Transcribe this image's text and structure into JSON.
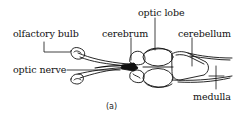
{
  "figure": {
    "caption": "(a)",
    "labels": {
      "olfactory_bulb": "olfactory bulb",
      "optic_nerve": "optic nerve",
      "cerebrum": "cerebrum",
      "optic_lobe": "optic lobe",
      "cerebellum": "cerebellum",
      "medulla": "medulla"
    },
    "colors": {
      "ink": "#111111",
      "background": "#ffffff"
    }
  }
}
